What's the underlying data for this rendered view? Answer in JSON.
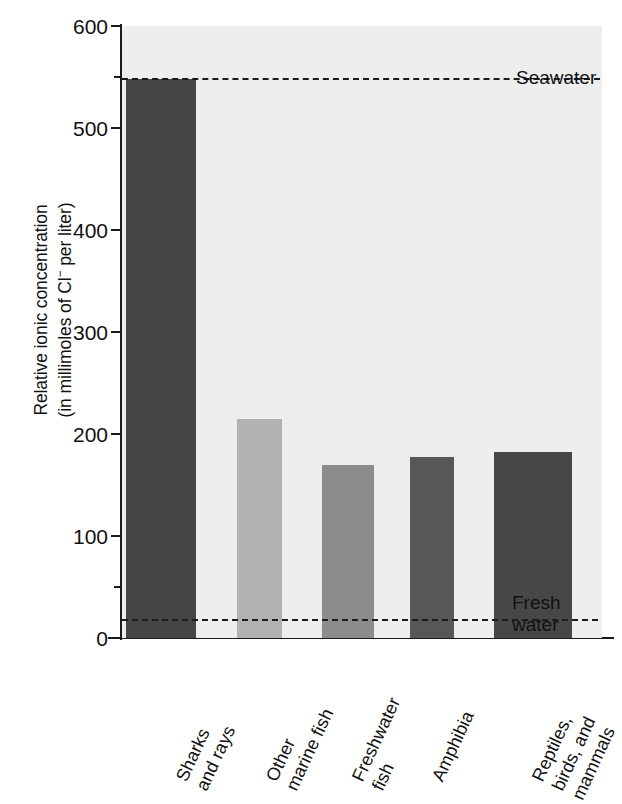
{
  "chart_data": {
    "type": "bar",
    "title": "",
    "subtitle": "",
    "xlabel": "",
    "ylabel_line1": "Relative ionic concentration",
    "ylabel_line2_pre": "(in millimoles of Cl",
    "ylabel_line2_sup": "−",
    "ylabel_line2_post": " per liter)",
    "ylim": [
      0,
      600
    ],
    "yticks": [
      0,
      100,
      200,
      300,
      400,
      500,
      600
    ],
    "ytick_labels": [
      "0",
      "100",
      "200",
      "300",
      "400",
      "500",
      "600"
    ],
    "yminor_ticks": [
      50,
      550
    ],
    "grid": false,
    "legend_position": "none",
    "categories": [
      "Sharks and rays",
      "Other marine fish",
      "Freshwater fish",
      "Amphibia",
      "Reptiles, birds, and mammals"
    ],
    "category_label_lines": [
      [
        "Sharks",
        "and rays"
      ],
      [
        "Other",
        "marine fish"
      ],
      [
        "Freshwater",
        "fish"
      ],
      [
        "Amphibia"
      ],
      [
        "Reptiles,",
        "birds, and",
        "mammals"
      ]
    ],
    "values": [
      548,
      215,
      170,
      177,
      182
    ],
    "bar_colors": [
      "#454545",
      "#b2b2b2",
      "#8c8c8c",
      "#575757",
      "#474747"
    ],
    "annotations": [
      {
        "label_lines": [
          "Seawater"
        ],
        "value": 548,
        "style": "dashed"
      },
      {
        "label_lines": [
          "Fresh",
          "water"
        ],
        "value": 18,
        "style": "dashed"
      }
    ],
    "plot_background": "#eeeeee",
    "axis_color": "#1b1b1b"
  }
}
